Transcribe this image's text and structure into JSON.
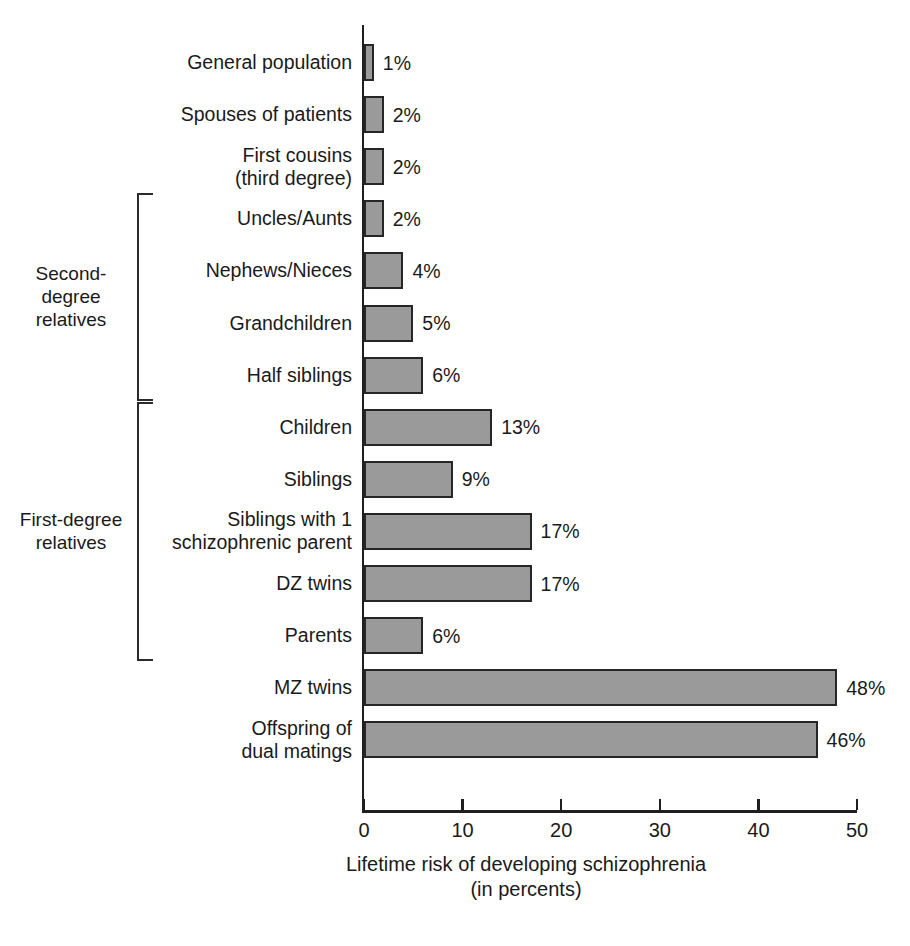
{
  "chart_data": {
    "type": "bar",
    "orientation": "horizontal",
    "title": "",
    "xlabel": "Lifetime risk of developing schizophrenia\n(in percents)",
    "ylabel": "",
    "xlim": [
      0,
      50
    ],
    "xticks": [
      0,
      10,
      20,
      30,
      40,
      50
    ],
    "xtick_labels": [
      "0",
      "10",
      "20",
      "30",
      "40",
      "50"
    ],
    "grid": false,
    "legend": false,
    "unit_suffix": "%",
    "categories": [
      "General population",
      "Spouses of patients",
      "First cousins\n(third degree)",
      "Uncles/Aunts",
      "Nephews/Nieces",
      "Grandchildren",
      "Half siblings",
      "Children",
      "Siblings",
      "Siblings with 1\nschizophrenic parent",
      "DZ twins",
      "Parents",
      "MZ twins",
      "Offspring of\ndual matings"
    ],
    "values": [
      1,
      2,
      2,
      2,
      4,
      5,
      6,
      13,
      9,
      17,
      17,
      6,
      48,
      46
    ],
    "value_labels": [
      "1%",
      "2%",
      "2%",
      "2%",
      "4%",
      "5%",
      "6%",
      "13%",
      "9%",
      "17%",
      "17%",
      "6%",
      "48%",
      "46%"
    ],
    "groups": [
      {
        "label": "Second-\ndegree\nrelatives",
        "first_index": 3,
        "last_index": 6
      },
      {
        "label": "First-degree\nrelatives",
        "first_index": 7,
        "last_index": 11
      }
    ],
    "colors": {
      "bar_fill": "#9a9a9a",
      "bar_border": "#262626",
      "axis": "#1f1f1f",
      "text": "#1a1a1a",
      "background": "#ffffff"
    }
  }
}
